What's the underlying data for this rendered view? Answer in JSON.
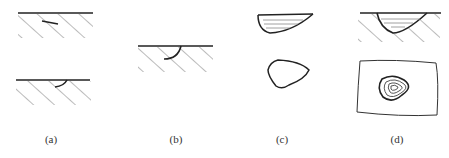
{
  "figure": {
    "panels": [
      {
        "id": "a",
        "label": "(a)",
        "description": "Surface with hatched substrate; top shows a short straight crack, bottom shows a small curved crack at surface"
      },
      {
        "id": "b",
        "label": "(b)",
        "description": "Surface with hatched substrate and semicircular pit beneath surface"
      },
      {
        "id": "c",
        "label": "(c)",
        "description": "Wedge-shaped cross-section with horizontal layers; below, a rounded triangular outline (plan view)"
      },
      {
        "id": "d",
        "label": "(d)",
        "description": "Hatched substrate with layered bowl-shaped pit; below, plan view with concentric rounded-triangle contours inside a rectangular outline"
      }
    ]
  },
  "colors": {
    "line": "#222222",
    "hatch": "#777777",
    "label": "#333333",
    "background": "#ffffff"
  }
}
